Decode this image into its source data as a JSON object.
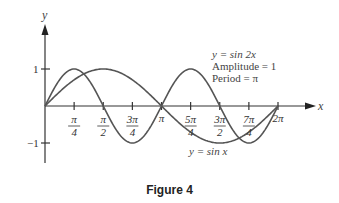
{
  "caption": "Figure 4",
  "chart_data": {
    "type": "line",
    "title": "Figure 4",
    "xlabel": "x",
    "ylabel": "y",
    "xlim": [
      0,
      6.2832
    ],
    "ylim": [
      -1,
      1
    ],
    "grid": false,
    "x_ticks": [
      "π/4",
      "π/2",
      "3π/4",
      "π",
      "5π/4",
      "3π/2",
      "7π/4",
      "2π"
    ],
    "x_tick_values": [
      0.7854,
      1.5708,
      2.3562,
      3.1416,
      3.927,
      4.7124,
      5.4978,
      6.2832
    ],
    "y_ticks": [
      "1",
      "−1"
    ],
    "y_tick_values": [
      1,
      -1
    ],
    "series": [
      {
        "name": "y = sin x",
        "function": "sin(x)",
        "amplitude": 1,
        "period": "2π",
        "x": [
          0,
          0.7854,
          1.5708,
          2.3562,
          3.1416,
          3.927,
          4.7124,
          5.4978,
          6.2832
        ],
        "values": [
          0,
          0.707,
          1,
          0.707,
          0,
          -0.707,
          -1,
          -0.707,
          0
        ]
      },
      {
        "name": "y = sin 2x",
        "function": "sin(2x)",
        "amplitude": 1,
        "period": "π",
        "x": [
          0,
          0.7854,
          1.5708,
          2.3562,
          3.1416,
          3.927,
          4.7124,
          5.4978,
          6.2832
        ],
        "values": [
          0,
          1,
          0,
          -1,
          0,
          1,
          0,
          -1,
          0
        ]
      }
    ],
    "annotations": [
      {
        "text": "y = sin 2x",
        "near": "upper right"
      },
      {
        "text": "Amplitude = 1"
      },
      {
        "text": "Period = π"
      },
      {
        "text": "y = sin x",
        "near": "lower right"
      }
    ]
  },
  "labels": {
    "x_axis": "x",
    "y_axis": "y",
    "y_one": "1",
    "y_neg_one": "−1",
    "ticks": [
      {
        "num": "π",
        "den": "4"
      },
      {
        "num": "π",
        "den": "2"
      },
      {
        "num": "3π",
        "den": "4"
      },
      {
        "single": "π"
      },
      {
        "num": "5π",
        "den": "4"
      },
      {
        "num": "3π",
        "den": "2"
      },
      {
        "num": "7π",
        "den": "4"
      },
      {
        "single": "2π"
      }
    ],
    "ann_sin2x": "y = sin 2x",
    "ann_amplitude": "Amplitude = 1",
    "ann_period": "Period = π",
    "ann_sinx": "y = sin x"
  }
}
